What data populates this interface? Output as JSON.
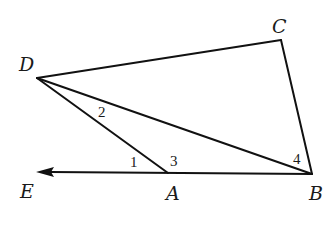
{
  "diagram": {
    "type": "geometry",
    "points": {
      "D": {
        "label": "D",
        "x": 37,
        "y": 78
      },
      "C": {
        "label": "C",
        "x": 281,
        "y": 40
      },
      "B": {
        "label": "B",
        "x": 312,
        "y": 174
      },
      "A": {
        "label": "A",
        "x": 168,
        "y": 173
      },
      "E": {
        "label": "E",
        "x": 36,
        "y": 172
      }
    },
    "segments": [
      {
        "from": "D",
        "to": "C"
      },
      {
        "from": "C",
        "to": "B"
      },
      {
        "from": "D",
        "to": "B"
      },
      {
        "from": "D",
        "to": "A"
      },
      {
        "from": "B",
        "to": "E",
        "arrow": "E"
      }
    ],
    "angle_labels": [
      {
        "label": "1",
        "at": "A",
        "between": [
          "E",
          "D"
        ]
      },
      {
        "label": "2",
        "at": "D",
        "between": [
          "A",
          "B"
        ]
      },
      {
        "label": "3",
        "at": "A",
        "between": [
          "D",
          "B"
        ]
      },
      {
        "label": "4",
        "at": "B",
        "between": [
          "D",
          "C"
        ]
      }
    ],
    "stroke_color": "#111111",
    "background_color": "#ffffff"
  }
}
